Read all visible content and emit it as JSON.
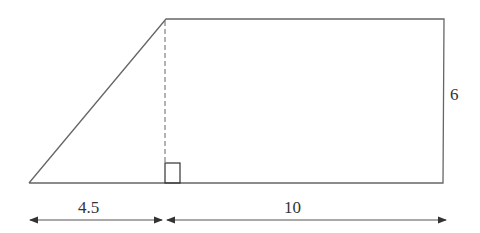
{
  "diagram": {
    "type": "trapezoid-dimension-figure",
    "shape": "right trapezoid",
    "colors": {
      "stroke": "#555555",
      "text": "#333333",
      "background": "#ffffff"
    },
    "dimensions": {
      "left_base_segment": "4.5",
      "right_base_segment": "10",
      "height": "6"
    },
    "annotations": {
      "right_angle_marker": true,
      "dashed_altitude": true
    }
  }
}
